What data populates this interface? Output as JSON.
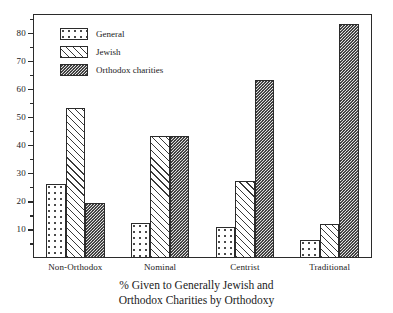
{
  "chart_data": {
    "type": "bar",
    "title": "",
    "caption_line_1": "% Given to Generally Jewish and",
    "caption_line_2": "Orthodox Charities by Orthodoxy",
    "xlabel": "",
    "ylabel": "",
    "ylim": [
      0,
      87
    ],
    "grid": false,
    "legend_position": "top-left",
    "categories": [
      "Non-Orthodox",
      "Nominal",
      "Centrist",
      "Traditional"
    ],
    "y_ticks_major": [
      10,
      20,
      30,
      40,
      50,
      60,
      70,
      80
    ],
    "y_tick_labels": [
      "10",
      "20",
      "30",
      "40",
      "50",
      "60",
      "70",
      "80"
    ],
    "y_ticks_minor": [
      5,
      15,
      25,
      35,
      45,
      55,
      65,
      75,
      85
    ],
    "series": [
      {
        "name": "General",
        "pattern": "sparse-dots",
        "values": [
          26.5,
          12.5,
          11.0,
          6.5
        ]
      },
      {
        "name": "Jewish",
        "pattern": "diagonal-hatch",
        "values": [
          53.5,
          43.5,
          27.5,
          12.0
        ]
      },
      {
        "name": "Orthodox charities",
        "pattern": "dense-checker-dots",
        "values": [
          19.5,
          43.5,
          63.5,
          83.5
        ]
      }
    ]
  },
  "legend": {
    "items": [
      {
        "label": "General"
      },
      {
        "label": "Jewish"
      },
      {
        "label": "Orthodox charities"
      }
    ]
  },
  "colors": {
    "axis": "#2b2b2b",
    "text": "#1a1a1a",
    "background": "#ffffff",
    "orthodox_fill": "#e2e2e2"
  }
}
